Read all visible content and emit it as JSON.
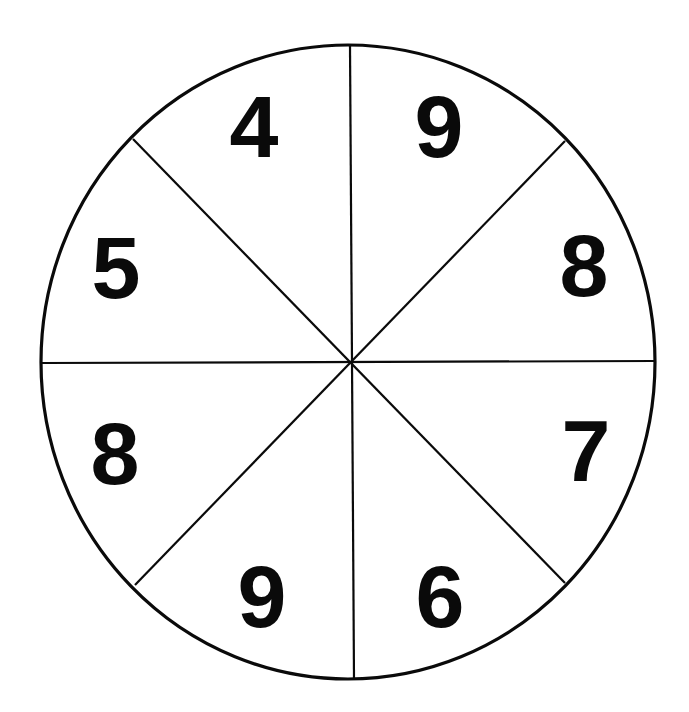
{
  "spinner": {
    "section_count": 8,
    "colors": {
      "background": "#ffffff",
      "ink": "#0a0a0a"
    },
    "sections": [
      {
        "position": "top-left",
        "label": "4"
      },
      {
        "position": "top-right",
        "label": "9"
      },
      {
        "position": "right-upper",
        "label": "8"
      },
      {
        "position": "right-lower",
        "label": "7"
      },
      {
        "position": "bottom-right",
        "label": "6"
      },
      {
        "position": "bottom-left",
        "label": "9"
      },
      {
        "position": "left-lower",
        "label": "8"
      },
      {
        "position": "left-upper",
        "label": "5"
      }
    ]
  }
}
